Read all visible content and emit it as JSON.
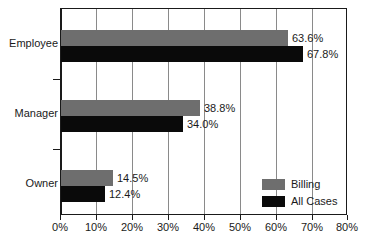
{
  "chart_data": {
    "type": "bar",
    "orientation": "horizontal",
    "title": "",
    "subtitle": "",
    "xlabel": "",
    "ylabel": "",
    "categories": [
      "Employee",
      "Manager",
      "Owner"
    ],
    "series": [
      {
        "name": "Billing",
        "color": "#6e6e6e",
        "values": [
          63.6,
          38.8,
          14.5
        ],
        "labels": [
          "63.6%",
          "38.8%",
          "14.5%"
        ]
      },
      {
        "name": "All Cases",
        "color": "#0a0a0a",
        "values": [
          67.8,
          34.0,
          12.4
        ],
        "labels": [
          "67.8%",
          "34.0%",
          "12.4%"
        ]
      }
    ],
    "xlim": [
      0,
      80
    ],
    "xticks": [
      0,
      10,
      20,
      30,
      40,
      50,
      60,
      70,
      80
    ],
    "xtick_labels": [
      "0%",
      "10%",
      "20%",
      "30%",
      "40%",
      "50%",
      "60%",
      "70%",
      "80%"
    ],
    "grid": "vertical",
    "legend_position": "inside-bottom-right",
    "legend": [
      {
        "label": "Billing",
        "color": "#6e6e6e"
      },
      {
        "label": "All Cases",
        "color": "#0a0a0a"
      }
    ]
  },
  "colors": {
    "billing": "#6e6e6e",
    "all_cases": "#0a0a0a",
    "axis": "#1a1a1a",
    "gridline": "#8a8a8a",
    "background": "#ffffff"
  }
}
